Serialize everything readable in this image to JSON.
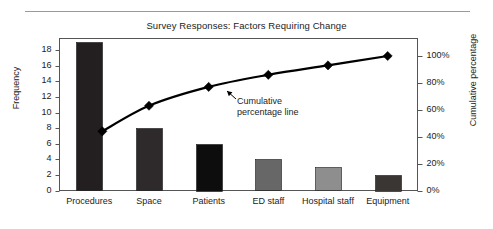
{
  "chart_data": {
    "type": "bar",
    "title": "Survey Responses: Factors Requiring Change",
    "xlabel": "",
    "ylabel": "Frequency",
    "y2label": "Cumulative percentage",
    "categories": [
      "Procedures",
      "Space",
      "Patients",
      "ED staff",
      "Hospital staff",
      "Equipment"
    ],
    "values": [
      19,
      8,
      6,
      4,
      3,
      2
    ],
    "cumulative_percent": [
      44,
      63,
      77,
      86,
      93,
      100
    ],
    "ylim": [
      0,
      19.5
    ],
    "y2lim": [
      0,
      113
    ],
    "yticks": [
      "0",
      "2",
      "4",
      "6",
      "8",
      "10",
      "12",
      "14",
      "16",
      "18"
    ],
    "ytick_values": [
      0,
      2,
      4,
      6,
      8,
      10,
      12,
      14,
      16,
      18
    ],
    "y2ticks": [
      "0%",
      "20%",
      "40%",
      "60%",
      "80%",
      "100%"
    ],
    "y2tick_values": [
      0,
      20,
      40,
      60,
      80,
      100
    ],
    "grid": false,
    "legend": "none",
    "bar_colors": [
      "#231f20",
      "#2e2a2b",
      "#0d0d0d",
      "#676767",
      "#8e8e8e",
      "#3a3634"
    ],
    "line_color": "#000000",
    "marker": "diamond",
    "annotations": [
      {
        "name": "cumulative-line-callout",
        "line1": "Cumulative",
        "line2": "percentage line"
      }
    ]
  }
}
